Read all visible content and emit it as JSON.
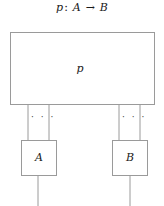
{
  "figure": {
    "caption": {
      "morphism": "p",
      "colon": ":",
      "source": "A",
      "arrow": "→",
      "target": "B"
    },
    "boxes": [
      {
        "id": "p",
        "label": "p",
        "x": 10,
        "y": 32,
        "width": 145,
        "height": 73
      },
      {
        "id": "a",
        "label": "A",
        "x": 21,
        "y": 140,
        "width": 36,
        "height": 36
      },
      {
        "id": "b",
        "label": "B",
        "x": 112,
        "y": 140,
        "width": 36,
        "height": 36
      }
    ],
    "wires": [
      {
        "name": "p-to-a-left",
        "x1": 28,
        "y1": 105,
        "x2": 28,
        "y2": 140
      },
      {
        "name": "p-to-a-right",
        "x1": 49,
        "y1": 105,
        "x2": 49,
        "y2": 140
      },
      {
        "name": "p-to-b-left",
        "x1": 119,
        "y1": 105,
        "x2": 119,
        "y2": 140
      },
      {
        "name": "p-to-b-right",
        "x1": 140,
        "y1": 105,
        "x2": 140,
        "y2": 140
      },
      {
        "name": "a-output",
        "x1": 38,
        "y1": 176,
        "x2": 38,
        "y2": 206
      },
      {
        "name": "b-output",
        "x1": 130,
        "y1": 176,
        "x2": 130,
        "y2": 206
      }
    ],
    "ellipses": [
      {
        "name": "left-wire-ellipsis",
        "text": "· · ·"
      },
      {
        "name": "right-wire-ellipsis",
        "text": "· · ·"
      }
    ],
    "colors": {
      "stroke": "#9a9a9a",
      "text": "#1a1a1a",
      "background": "#ffffff"
    }
  }
}
